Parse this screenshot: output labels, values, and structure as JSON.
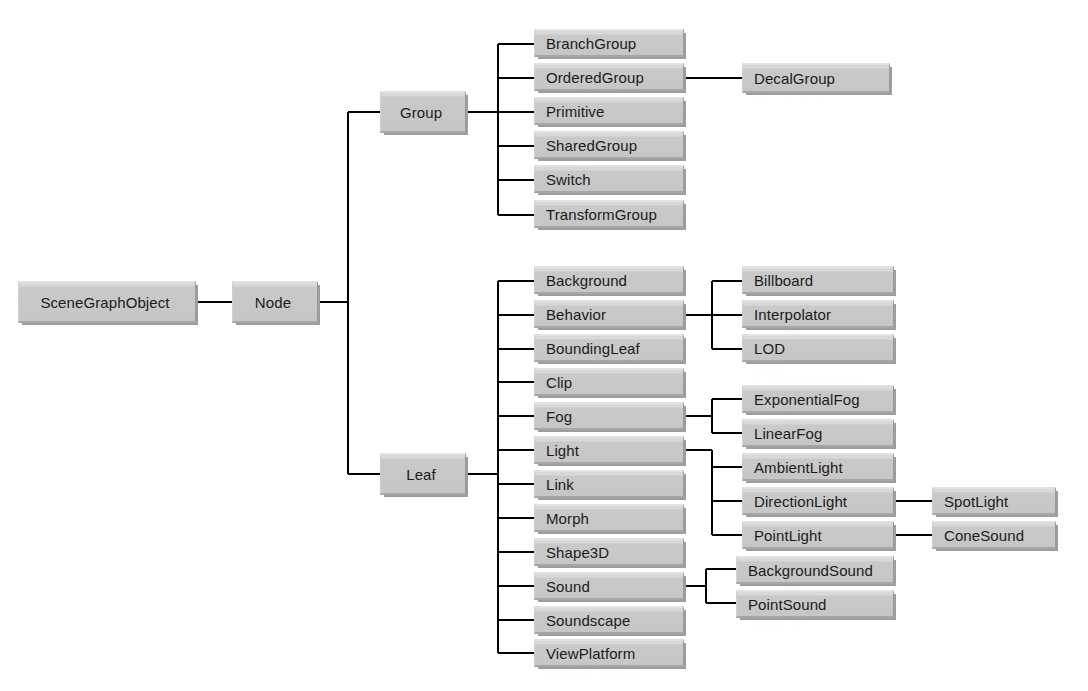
{
  "diagram": {
    "type": "class-hierarchy-tree",
    "background_color": "#ffffff",
    "box_fill_color": "#c9c9c9",
    "box_highlight_color": "#d8d8d8",
    "box_shadow_color": "#9d9d9d",
    "line_color": "#000000",
    "text_color": "#1b1b1b"
  },
  "nodes": {
    "root": "SceneGraphObject",
    "node": "Node",
    "group": "Group",
    "leaf": "Leaf",
    "group_children": [
      "BranchGroup",
      "OrderedGroup",
      "Primitive",
      "SharedGroup",
      "Switch",
      "TransformGroup"
    ],
    "ordered_group_children": [
      "DecalGroup"
    ],
    "leaf_children": [
      "Background",
      "Behavior",
      "BoundingLeaf",
      "Clip",
      "Fog",
      "Light",
      "Link",
      "Morph",
      "Shape3D",
      "Sound",
      "Soundscape",
      "ViewPlatform"
    ],
    "behavior_children": [
      "Billboard",
      "Interpolator",
      "LOD"
    ],
    "fog_children": [
      "ExponentialFog",
      "LinearFog"
    ],
    "light_children": [
      "AmbientLight",
      "DirectionLight",
      "PointLight"
    ],
    "direction_light_children": [
      "SpotLight"
    ],
    "point_light_children": [
      "ConeSound"
    ],
    "sound_children": [
      "BackgroundSound",
      "PointSound"
    ]
  }
}
